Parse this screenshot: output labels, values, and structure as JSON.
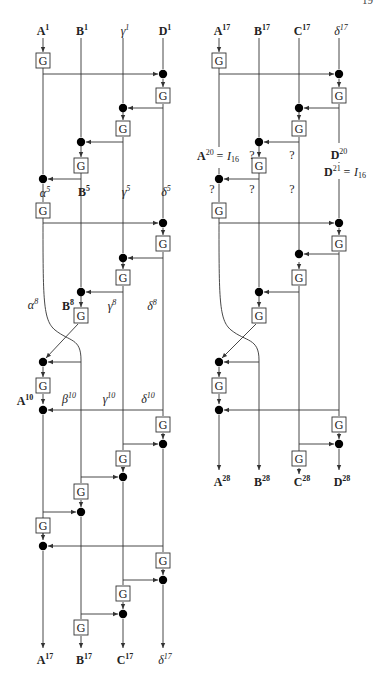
{
  "page": {
    "number_fragment": "19"
  },
  "left_diagram": {
    "inputs": [
      {
        "name": "A",
        "sup": "1",
        "style": "bold"
      },
      {
        "name": "B",
        "sup": "1",
        "style": "bold"
      },
      {
        "name": "γ",
        "sup": "1",
        "style": "italic"
      },
      {
        "name": "D",
        "sup": "1",
        "style": "bold"
      }
    ],
    "mid_labels_round5": [
      {
        "name": "α",
        "sup": "5",
        "style": "italic"
      },
      {
        "name": "B",
        "sup": "5",
        "style": "bold"
      },
      {
        "name": "γ",
        "sup": "5",
        "style": "italic"
      },
      {
        "name": "δ",
        "sup": "5",
        "style": "italic"
      }
    ],
    "mid_labels_round8": [
      {
        "name": "α",
        "sup": "8",
        "style": "italic"
      },
      {
        "name": "B",
        "sup": "8",
        "style": "bold"
      },
      {
        "name": "γ",
        "sup": "8",
        "style": "italic"
      },
      {
        "name": "δ",
        "sup": "8",
        "style": "italic"
      }
    ],
    "mid_labels_round10": [
      {
        "name": "A",
        "sup": "10",
        "style": "bold"
      },
      {
        "name": "β",
        "sup": "10",
        "style": "italic"
      },
      {
        "name": "γ",
        "sup": "10",
        "style": "italic"
      },
      {
        "name": "δ",
        "sup": "10",
        "style": "italic"
      }
    ],
    "outputs": [
      {
        "name": "A",
        "sup": "17",
        "style": "bold"
      },
      {
        "name": "B",
        "sup": "17",
        "style": "bold"
      },
      {
        "name": "C",
        "sup": "17",
        "style": "bold"
      },
      {
        "name": "δ",
        "sup": "17",
        "style": "italic"
      }
    ],
    "gate_label": "G"
  },
  "right_diagram": {
    "inputs": [
      {
        "name": "A",
        "sup": "17",
        "style": "bold"
      },
      {
        "name": "B",
        "sup": "17",
        "style": "bold"
      },
      {
        "name": "C",
        "sup": "17",
        "style": "bold"
      },
      {
        "name": "δ",
        "sup": "17",
        "style": "italic"
      }
    ],
    "annotations": {
      "a20": {
        "text": "A",
        "sup": "20",
        "eq": "= I",
        "sub": "16"
      },
      "d20": {
        "text": "D",
        "sup": "20"
      },
      "d21": {
        "text": "D",
        "sup": "21",
        "eq": "= I",
        "sub": "16"
      },
      "unknown": "?"
    },
    "outputs": [
      {
        "name": "A",
        "sup": "28",
        "style": "bold"
      },
      {
        "name": "B",
        "sup": "28",
        "style": "bold"
      },
      {
        "name": "C",
        "sup": "28",
        "style": "bold"
      },
      {
        "name": "D",
        "sup": "28",
        "style": "bold"
      }
    ],
    "gate_label": "G"
  }
}
